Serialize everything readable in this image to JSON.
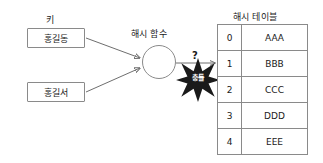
{
  "diagram": {
    "keys": {
      "label": "키",
      "items": [
        {
          "text": "홍길동"
        },
        {
          "text": "홍길서"
        }
      ]
    },
    "hash_function": {
      "label": "해시 함수",
      "shape": "circle-icon"
    },
    "question_marker": {
      "text": "?"
    },
    "collision": {
      "text": "충돌",
      "shape": "starburst-icon",
      "fill_color": "#1a1a1a",
      "text_color": "#ffffff"
    },
    "hash_table": {
      "label": "해시 테이블",
      "columns": [
        "index",
        "value"
      ],
      "rows": [
        {
          "index": "0",
          "value": "AAA"
        },
        {
          "index": "1",
          "value": "BBB"
        },
        {
          "index": "2",
          "value": "CCC"
        },
        {
          "index": "3",
          "value": "DDD"
        },
        {
          "index": "4",
          "value": "EEE"
        }
      ]
    },
    "colors": {
      "stroke": "#8a8a8a",
      "connector": "#6e6e6e",
      "text": "#1a1a1a",
      "background": "#ffffff"
    }
  }
}
